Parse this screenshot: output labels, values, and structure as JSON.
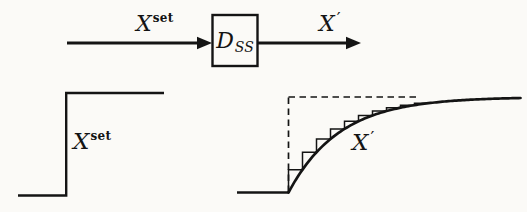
{
  "colors": {
    "ink": "#141414",
    "paper": "#fbfaf7"
  },
  "labels": {
    "block_input": {
      "base": "X",
      "sup": "set"
    },
    "block_name": {
      "base": "D",
      "sub": "SS"
    },
    "block_output": {
      "base": "X",
      "prime": "′"
    },
    "step_plot": {
      "base": "X",
      "sup": "set"
    },
    "response_plot": {
      "base": "X",
      "prime": "′"
    }
  },
  "chart_data": [
    {
      "type": "line",
      "name": "setpoint-step-input",
      "label": "X set (step input)",
      "x": [
        0,
        0.33,
        0.33,
        1
      ],
      "y": [
        0,
        0,
        1,
        1
      ],
      "grid": false,
      "axes_shown": false
    },
    {
      "type": "line",
      "name": "first-order-response",
      "label": "X′ (lagged response)",
      "model": "y(t) = 1 - exp(-t/tau) for t >= 0, 0 before",
      "tau_fraction": 0.22,
      "x_range": [
        0,
        1
      ],
      "y_range": [
        0,
        1
      ],
      "overlay": "discrete-staircase-approximation",
      "stair_steps": 10,
      "reference": "dashed step outline at final value 1",
      "grid": false,
      "axes_shown": false
    }
  ]
}
